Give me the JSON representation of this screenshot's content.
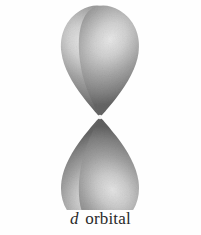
{
  "figure": {
    "kind": "atomic-orbital-diagram",
    "caption_symbol": "d",
    "caption_word": "orbital",
    "caption_full": "d orbital",
    "background_color": "#fefefe",
    "lobe_count": 4,
    "lobe_fill_mid": "#8d8d8d",
    "lobe_fill_dark": "#6b6b6b",
    "lobe_fill_edge": "#5a5a5a",
    "lobe_highlight": "#e2e2e2",
    "caption_color": "#2a2a2a",
    "center_x": 100,
    "center_y": 117,
    "lobes": [
      {
        "name": "upper-left-lobe",
        "angle_deg": 218,
        "tip_x": 100,
        "tip_y": 117
      },
      {
        "name": "upper-right-lobe",
        "angle_deg": 322,
        "tip_x": 100,
        "tip_y": 117
      },
      {
        "name": "lower-left-lobe",
        "angle_deg": 142,
        "tip_x": 100,
        "tip_y": 117
      },
      {
        "name": "lower-right-lobe",
        "angle_deg": 38,
        "tip_x": 100,
        "tip_y": 117
      }
    ]
  }
}
